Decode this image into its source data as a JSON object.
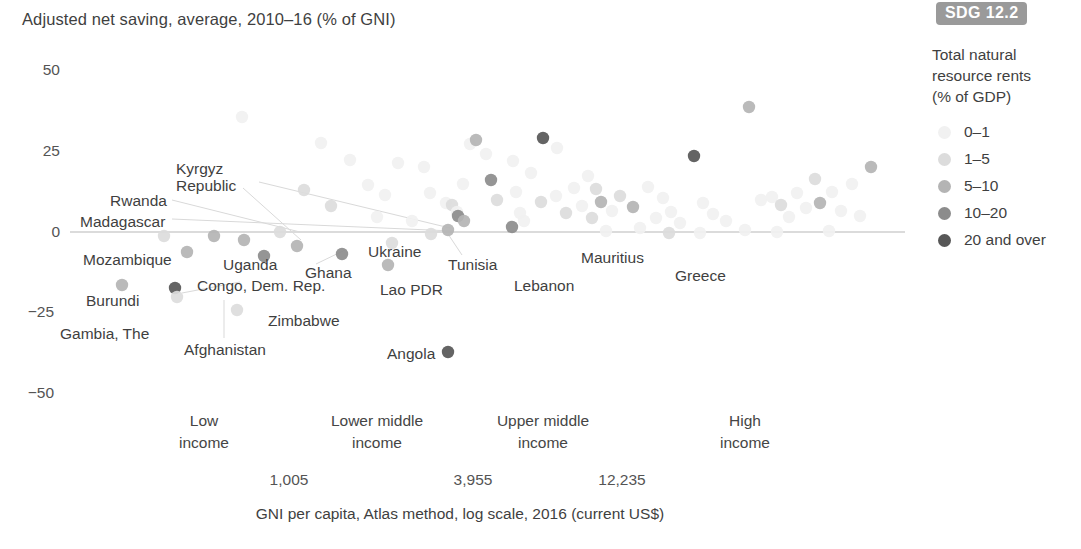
{
  "chart_title": "Adjusted net saving, average, 2010–16 (% of GNI)",
  "badge": {
    "label": "SDG 12.2"
  },
  "legend": {
    "title_line1": "Total natural",
    "title_line2": "resource rents",
    "title_line3": "(% of GDP)",
    "items": [
      {
        "label": "0–1",
        "color": "#f1f1f1"
      },
      {
        "label": "1–5",
        "color": "#dcdcdc"
      },
      {
        "label": "5–10",
        "color": "#b4b4b4"
      },
      {
        "label": "10–20",
        "color": "#8c8c8c"
      },
      {
        "label": "20 and over",
        "color": "#575757"
      }
    ]
  },
  "axis": {
    "y_ticks": [
      "50",
      "25",
      "0",
      "−25",
      "−50"
    ],
    "x_groups": [
      {
        "line1": "Low",
        "line2": "income"
      },
      {
        "line1": "Lower middle",
        "line2": "income"
      },
      {
        "line1": "Upper middle",
        "line2": "income"
      },
      {
        "line1": "High",
        "line2": "income"
      }
    ],
    "x_thresholds": [
      "1,005",
      "3,955",
      "12,235"
    ],
    "x_axis_title": "GNI per capita, Atlas method, log scale, 2016 (current US$)"
  },
  "country_labels": [
    {
      "name": "Kyrgyz Republic",
      "line1": "Kyrgyz",
      "line2": "Republic"
    },
    {
      "name": "Rwanda",
      "line1": "Rwanda",
      "line2": ""
    },
    {
      "name": "Madagascar",
      "line1": "Madagascar",
      "line2": ""
    },
    {
      "name": "Mozambique",
      "line1": "Mozambique",
      "line2": ""
    },
    {
      "name": "Uganda",
      "line1": "Uganda",
      "line2": ""
    },
    {
      "name": "Ghana",
      "line1": "Ghana",
      "line2": ""
    },
    {
      "name": "Burundi",
      "line1": "Burundi",
      "line2": ""
    },
    {
      "name": "Congo, Dem. Rep.",
      "line1": "Congo, Dem. Rep.",
      "line2": ""
    },
    {
      "name": "Gambia, The",
      "line1": "Gambia, The",
      "line2": ""
    },
    {
      "name": "Afghanistan",
      "line1": "Afghanistan",
      "line2": ""
    },
    {
      "name": "Zimbabwe",
      "line1": "Zimbabwe",
      "line2": ""
    },
    {
      "name": "Ukraine",
      "line1": "Ukraine",
      "line2": ""
    },
    {
      "name": "Lao PDR",
      "line1": "Lao PDR",
      "line2": ""
    },
    {
      "name": "Tunisia",
      "line1": "Tunisia",
      "line2": ""
    },
    {
      "name": "Lebanon",
      "line1": "Lebanon",
      "line2": ""
    },
    {
      "name": "Mauritius",
      "line1": "Mauritius",
      "line2": ""
    },
    {
      "name": "Greece",
      "line1": "Greece",
      "line2": ""
    },
    {
      "name": "Angola",
      "line1": "Angola",
      "line2": ""
    }
  ],
  "chart_data": {
    "type": "scatter",
    "title": "Adjusted net saving, average, 2010–16 (% of GNI)",
    "xlabel": "GNI per capita, Atlas method, log scale, 2016 (current US$)",
    "ylabel": "Adjusted net saving, average, 2010–16 (% of GNI)",
    "ylim": [
      -50,
      50
    ],
    "y_ticks": [
      50,
      25,
      0,
      -25,
      -50
    ],
    "x_scale": "log",
    "x_income_groups": [
      "Low income",
      "Lower middle income",
      "Upper middle income",
      "High income"
    ],
    "x_group_boundaries": [
      1005,
      3955,
      12235
    ],
    "grid": false,
    "zero_line": true,
    "legend_position": "right",
    "color_legend": {
      "title": "Total natural resource rents (% of GDP)",
      "bins": [
        "0–1",
        "1–5",
        "5–10",
        "10–20",
        "20 and over"
      ],
      "colors": [
        "#f1f1f1",
        "#dcdcdc",
        "#b4b4b4",
        "#8c8c8c",
        "#575757"
      ]
    },
    "labeled_points": [
      {
        "country": "Madagascar",
        "ans": 0,
        "rents_bin": "5–10"
      },
      {
        "country": "Rwanda",
        "ans": -2,
        "rents_bin": "5–10"
      },
      {
        "country": "Mozambique",
        "ans": -5,
        "rents_bin": "5–10"
      },
      {
        "country": "Burundi",
        "ans": -21,
        "rents_bin": "5–10"
      },
      {
        "country": "Gambia, The",
        "ans": -24,
        "rents_bin": "1–5"
      },
      {
        "country": "Congo, Dem. Rep.",
        "ans": -22,
        "rents_bin": "20 and over"
      },
      {
        "country": "Afghanistan",
        "ans": -24,
        "rents_bin": "0–1"
      },
      {
        "country": "Uganda",
        "ans": -6,
        "rents_bin": "10–20"
      },
      {
        "country": "Kyrgyz Republic",
        "ans": -1,
        "rents_bin": "5–10"
      },
      {
        "country": "Ghana",
        "ans": -8,
        "rents_bin": "10–20"
      },
      {
        "country": "Zimbabwe",
        "ans": -17,
        "rents_bin": "1–5"
      },
      {
        "country": "Ukraine",
        "ans": 1,
        "rents_bin": "5–10"
      },
      {
        "country": "Lao PDR",
        "ans": -5,
        "rents_bin": "10–20"
      },
      {
        "country": "Tunisia",
        "ans": -2,
        "rents_bin": "5–10"
      },
      {
        "country": "Lebanon",
        "ans": -4,
        "rents_bin": "0–1"
      },
      {
        "country": "Mauritius",
        "ans": 2,
        "rents_bin": "0–1"
      },
      {
        "country": "Greece",
        "ans": 0,
        "rents_bin": "0–1"
      },
      {
        "country": "Angola",
        "ans": -35,
        "rents_bin": "20 and over"
      }
    ],
    "points": [
      {
        "x": 242,
        "y": 117,
        "bin": 1
      },
      {
        "x": 321,
        "y": 143,
        "bin": 1
      },
      {
        "x": 350,
        "y": 160,
        "bin": 1
      },
      {
        "x": 304,
        "y": 190,
        "bin": 2
      },
      {
        "x": 331,
        "y": 206,
        "bin": 2
      },
      {
        "x": 280,
        "y": 232,
        "bin": 2
      },
      {
        "x": 368,
        "y": 185,
        "bin": 1
      },
      {
        "x": 385,
        "y": 195,
        "bin": 1
      },
      {
        "x": 377,
        "y": 217,
        "bin": 1
      },
      {
        "x": 398,
        "y": 163,
        "bin": 1
      },
      {
        "x": 424,
        "y": 167,
        "bin": 1
      },
      {
        "x": 430,
        "y": 193,
        "bin": 1
      },
      {
        "x": 412,
        "y": 221,
        "bin": 1
      },
      {
        "x": 446,
        "y": 203,
        "bin": 1
      },
      {
        "x": 452,
        "y": 205,
        "bin": 2
      },
      {
        "x": 457,
        "y": 212,
        "bin": 1
      },
      {
        "x": 470,
        "y": 144,
        "bin": 1
      },
      {
        "x": 476,
        "y": 140,
        "bin": 3
      },
      {
        "x": 463,
        "y": 184,
        "bin": 1
      },
      {
        "x": 491,
        "y": 180,
        "bin": 4
      },
      {
        "x": 486,
        "y": 154,
        "bin": 1
      },
      {
        "x": 497,
        "y": 200,
        "bin": 2
      },
      {
        "x": 513,
        "y": 161,
        "bin": 1
      },
      {
        "x": 516,
        "y": 192,
        "bin": 1
      },
      {
        "x": 520,
        "y": 213,
        "bin": 1
      },
      {
        "x": 531,
        "y": 173,
        "bin": 1
      },
      {
        "x": 543,
        "y": 138,
        "bin": 5
      },
      {
        "x": 557,
        "y": 148,
        "bin": 1
      },
      {
        "x": 541,
        "y": 202,
        "bin": 2
      },
      {
        "x": 556,
        "y": 196,
        "bin": 1
      },
      {
        "x": 566,
        "y": 213,
        "bin": 2
      },
      {
        "x": 574,
        "y": 188,
        "bin": 1
      },
      {
        "x": 582,
        "y": 206,
        "bin": 1
      },
      {
        "x": 588,
        "y": 176,
        "bin": 1
      },
      {
        "x": 596,
        "y": 189,
        "bin": 2
      },
      {
        "x": 601,
        "y": 202,
        "bin": 3
      },
      {
        "x": 592,
        "y": 218,
        "bin": 2
      },
      {
        "x": 612,
        "y": 211,
        "bin": 1
      },
      {
        "x": 620,
        "y": 196,
        "bin": 2
      },
      {
        "x": 633,
        "y": 207,
        "bin": 3
      },
      {
        "x": 648,
        "y": 187,
        "bin": 1
      },
      {
        "x": 656,
        "y": 218,
        "bin": 1
      },
      {
        "x": 663,
        "y": 198,
        "bin": 1
      },
      {
        "x": 671,
        "y": 212,
        "bin": 1
      },
      {
        "x": 680,
        "y": 223,
        "bin": 1
      },
      {
        "x": 694,
        "y": 156,
        "bin": 5
      },
      {
        "x": 703,
        "y": 203,
        "bin": 1
      },
      {
        "x": 713,
        "y": 214,
        "bin": 1
      },
      {
        "x": 726,
        "y": 221,
        "bin": 1
      },
      {
        "x": 749,
        "y": 107,
        "bin": 3
      },
      {
        "x": 761,
        "y": 200,
        "bin": 1
      },
      {
        "x": 772,
        "y": 197,
        "bin": 1
      },
      {
        "x": 781,
        "y": 205,
        "bin": 2
      },
      {
        "x": 789,
        "y": 217,
        "bin": 1
      },
      {
        "x": 797,
        "y": 193,
        "bin": 1
      },
      {
        "x": 806,
        "y": 208,
        "bin": 1
      },
      {
        "x": 815,
        "y": 179,
        "bin": 2
      },
      {
        "x": 820,
        "y": 203,
        "bin": 3
      },
      {
        "x": 832,
        "y": 192,
        "bin": 1
      },
      {
        "x": 841,
        "y": 211,
        "bin": 1
      },
      {
        "x": 852,
        "y": 184,
        "bin": 1
      },
      {
        "x": 871,
        "y": 167,
        "bin": 3
      },
      {
        "x": 860,
        "y": 216,
        "bin": 1
      },
      {
        "x": 214,
        "y": 236,
        "bin": 3
      },
      {
        "x": 187,
        "y": 252,
        "bin": 3
      },
      {
        "x": 244,
        "y": 240,
        "bin": 3
      },
      {
        "x": 264,
        "y": 256,
        "bin": 4
      },
      {
        "x": 297,
        "y": 246,
        "bin": 3
      },
      {
        "x": 342,
        "y": 254,
        "bin": 4
      },
      {
        "x": 164,
        "y": 236,
        "bin": 2
      },
      {
        "x": 122,
        "y": 285,
        "bin": 3
      },
      {
        "x": 175,
        "y": 288,
        "bin": 5
      },
      {
        "x": 177,
        "y": 297,
        "bin": 2
      },
      {
        "x": 237,
        "y": 310,
        "bin": 2
      },
      {
        "x": 392,
        "y": 243,
        "bin": 2
      },
      {
        "x": 388,
        "y": 265,
        "bin": 3
      },
      {
        "x": 448,
        "y": 230,
        "bin": 3
      },
      {
        "x": 448,
        "y": 352,
        "bin": 5
      },
      {
        "x": 524,
        "y": 221,
        "bin": 1
      },
      {
        "x": 512,
        "y": 227,
        "bin": 4
      },
      {
        "x": 606,
        "y": 231,
        "bin": 1
      },
      {
        "x": 640,
        "y": 228,
        "bin": 1
      },
      {
        "x": 700,
        "y": 233,
        "bin": 1
      },
      {
        "x": 745,
        "y": 230,
        "bin": 1
      },
      {
        "x": 777,
        "y": 232,
        "bin": 1
      },
      {
        "x": 829,
        "y": 231,
        "bin": 1
      },
      {
        "x": 669,
        "y": 233,
        "bin": 2
      },
      {
        "x": 431,
        "y": 234,
        "bin": 2
      },
      {
        "x": 458,
        "y": 216,
        "bin": 4
      },
      {
        "x": 464,
        "y": 221,
        "bin": 3
      }
    ]
  }
}
